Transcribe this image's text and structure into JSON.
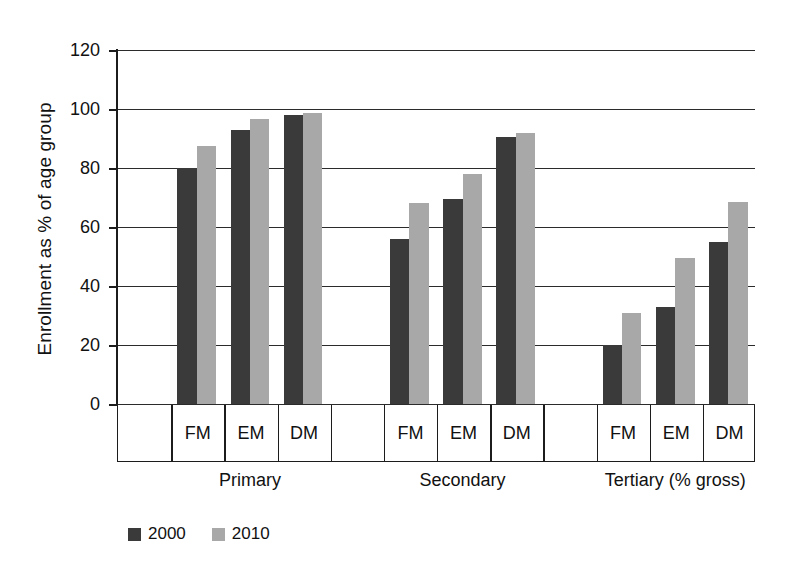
{
  "chart_data": {
    "type": "bar",
    "title": "",
    "xlabel": "",
    "ylabel": "Enrollment as % of age group",
    "ylim": [
      0,
      120
    ],
    "yticks": [
      0,
      20,
      40,
      60,
      80,
      100,
      120
    ],
    "grid": true,
    "legend_position": "bottom-left",
    "groups": [
      "Primary",
      "Secondary",
      "Tertiary (% gross)"
    ],
    "categories": [
      "FM",
      "EM",
      "DM",
      "FM",
      "EM",
      "DM",
      "FM",
      "EM",
      "DM"
    ],
    "series": [
      {
        "name": "2000",
        "color": "#3a3a3a",
        "values": [
          80,
          93,
          98,
          56,
          69.5,
          90.5,
          20,
          33,
          55
        ]
      },
      {
        "name": "2010",
        "color": "#a8a8a8",
        "values": [
          87.5,
          96.5,
          98.5,
          68,
          78,
          92,
          31,
          49.5,
          68.5
        ]
      }
    ],
    "grouped_values": {
      "Primary": {
        "FM": {
          "2000": 80,
          "2010": 87.5
        },
        "EM": {
          "2000": 93,
          "2010": 96.5
        },
        "DM": {
          "2000": 98,
          "2010": 98.5
        }
      },
      "Secondary": {
        "FM": {
          "2000": 56,
          "2010": 68
        },
        "EM": {
          "2000": 69.5,
          "2010": 78
        },
        "DM": {
          "2000": 90.5,
          "2010": 92
        }
      },
      "Tertiary (% gross)": {
        "FM": {
          "2000": 20,
          "2010": 31
        },
        "EM": {
          "2000": 33,
          "2010": 49.5
        },
        "DM": {
          "2000": 55,
          "2010": 68.5
        }
      }
    }
  },
  "axis": {
    "y_title": "Enrollment as % of age group",
    "tick_labels": [
      "120",
      "100",
      "80",
      "60",
      "40",
      "20",
      "0"
    ]
  },
  "label_band": {
    "cells": [
      "",
      "FM",
      "EM",
      "DM",
      "",
      "FM",
      "EM",
      "DM",
      "",
      "FM",
      "EM",
      "DM"
    ]
  },
  "group_labels": [
    "Primary",
    "Secondary",
    "Tertiary (% gross)"
  ],
  "legend": {
    "items": [
      {
        "label": "2000",
        "color": "#3a3a3a"
      },
      {
        "label": "2010",
        "color": "#a8a8a8"
      }
    ]
  },
  "colors": {
    "series_2000": "#3a3a3a",
    "series_2010": "#a8a8a8",
    "axis": "#1c1c1c",
    "grid": "#2b2b2b",
    "background": "#ffffff"
  }
}
